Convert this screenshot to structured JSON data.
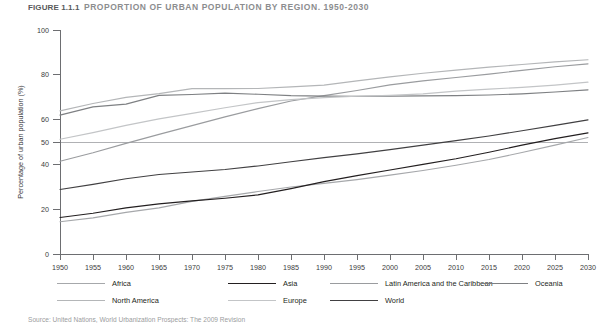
{
  "title": {
    "figure_number": "FIGURE 1.1.1",
    "text": "PROPORTION OF URBAN POPULATION BY REGION, 1950-2030"
  },
  "source_note": "Source: United Nations, World Urbanization Prospects: The 2009 Revision",
  "colors": {
    "axis": "#6d6e71",
    "reference_line": "#a7a9ac",
    "africa": "#a6a8ab",
    "asia": "#231f20",
    "latin_america": "#9a9c9f",
    "oceania": "#7e8083",
    "north_america": "#b4b6b8",
    "europe": "#c3c5c7",
    "world": "#414042"
  },
  "chart_data": {
    "type": "line",
    "title": "PROPORTION OF URBAN POPULATION BY REGION, 1950-2030",
    "xlabel": "",
    "ylabel": "Percentage of urban population (%)",
    "xlim": [
      1950,
      2030
    ],
    "ylim": [
      0,
      100
    ],
    "grid": false,
    "reference_lines": [
      {
        "axis": "y",
        "value": 50
      }
    ],
    "legend_position": "bottom",
    "x": [
      1950,
      1955,
      1960,
      1965,
      1970,
      1975,
      1980,
      1985,
      1990,
      1995,
      2000,
      2005,
      2010,
      2015,
      2020,
      2025,
      2030
    ],
    "xtick_labels": [
      "1950",
      "1955",
      "1960",
      "1965",
      "1970",
      "1975",
      "1980",
      "1985",
      "1990",
      "1995",
      "2000",
      "2005",
      "2010",
      "2015",
      "2020",
      "2025",
      "2030"
    ],
    "ytick_labels": [
      "0",
      "20",
      "40",
      "50",
      "60",
      "80",
      "100"
    ],
    "yticks": [
      0,
      20,
      40,
      50,
      60,
      80,
      100
    ],
    "series": [
      {
        "name": "Africa",
        "color": "#a6a8ab",
        "values": [
          14.4,
          16.1,
          18.6,
          20.6,
          23.5,
          25.7,
          27.9,
          29.9,
          31.5,
          33.2,
          35.2,
          37.3,
          39.6,
          42.2,
          45.3,
          48.6,
          52.0
        ]
      },
      {
        "name": "Asia",
        "color": "#231f20",
        "values": [
          16.3,
          18.2,
          20.6,
          22.4,
          23.7,
          24.9,
          26.4,
          29.2,
          32.3,
          35.0,
          37.5,
          40.0,
          42.5,
          45.4,
          48.6,
          51.5,
          54.1
        ]
      },
      {
        "name": "Latin America and the Caribbean",
        "color": "#9a9c9f",
        "values": [
          41.4,
          45.2,
          49.4,
          53.4,
          57.3,
          61.2,
          64.9,
          68.3,
          70.7,
          73.0,
          75.5,
          77.3,
          78.8,
          80.3,
          82.0,
          83.6,
          84.9
        ]
      },
      {
        "name": "Oceania",
        "color": "#7e8083",
        "values": [
          62.0,
          65.7,
          66.9,
          70.8,
          71.2,
          71.8,
          71.3,
          70.7,
          70.5,
          70.4,
          70.5,
          70.6,
          70.7,
          71.0,
          71.5,
          72.3,
          73.3
        ]
      },
      {
        "name": "North America",
        "color": "#b4b6b8",
        "values": [
          63.9,
          67.2,
          69.9,
          71.6,
          73.8,
          73.8,
          73.9,
          74.6,
          75.4,
          77.3,
          79.1,
          80.7,
          82.1,
          83.4,
          84.6,
          85.8,
          86.7
        ]
      },
      {
        "name": "Europe",
        "color": "#c3c5c7",
        "values": [
          51.2,
          54.2,
          57.4,
          60.3,
          62.8,
          65.3,
          67.6,
          68.9,
          69.8,
          70.4,
          70.8,
          71.5,
          72.7,
          73.6,
          74.4,
          75.4,
          76.7
        ]
      },
      {
        "name": "World",
        "color": "#414042",
        "values": [
          28.8,
          31.1,
          33.6,
          35.5,
          36.6,
          37.7,
          39.3,
          41.2,
          43.0,
          44.7,
          46.6,
          48.6,
          50.6,
          52.7,
          55.0,
          57.4,
          59.9
        ]
      }
    ]
  },
  "legend": {
    "items": [
      {
        "label": "Africa",
        "color": "#a6a8ab"
      },
      {
        "label": "Asia",
        "color": "#231f20"
      },
      {
        "label": "Latin America and the Caribbean",
        "color": "#9a9c9f"
      },
      {
        "label": "Oceania",
        "color": "#7e8083"
      },
      {
        "label": "North America",
        "color": "#b4b6b8"
      },
      {
        "label": "Europe",
        "color": "#c3c5c7"
      },
      {
        "label": "World",
        "color": "#414042"
      }
    ]
  }
}
